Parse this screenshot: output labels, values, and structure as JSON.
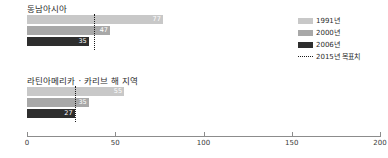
{
  "chart_data": {
    "type": "bar",
    "orientation": "horizontal",
    "title": "",
    "xlabel": "",
    "ylabel": "",
    "xlim": [
      0,
      200
    ],
    "xticks": [
      0,
      50,
      100,
      150,
      200
    ],
    "xtick_labels": [
      "0",
      "50",
      "100",
      "150",
      "200"
    ],
    "grid": false,
    "legend_position": "right",
    "categories": [
      "동남아시아",
      "라틴아메리카 · 카리브 해 지역"
    ],
    "series": [
      {
        "name": "1991년",
        "color": "#c8c8c8",
        "values": [
          77,
          55
        ]
      },
      {
        "name": "2000년",
        "color": "#a8a8a8",
        "values": [
          47,
          35
        ]
      },
      {
        "name": "2006년",
        "color": "#2e2e2e",
        "values": [
          35,
          27
        ]
      }
    ],
    "target_line": {
      "name": "2015년 목표치",
      "style": "dotted",
      "color": "#1a1a1a",
      "values": [
        38,
        27
      ]
    },
    "groups": [
      {
        "label": "동남아시아",
        "target": 38,
        "bars": [
          {
            "series": "1991년",
            "value": 77,
            "label": "77",
            "color": "#c8c8c8"
          },
          {
            "series": "2000년",
            "value": 47,
            "label": "47",
            "color": "#a8a8a8"
          },
          {
            "series": "2006년",
            "value": 35,
            "label": "35",
            "color": "#2e2e2e"
          }
        ]
      },
      {
        "label": "라틴아메리카 · 카리브 해 지역",
        "target": 27,
        "bars": [
          {
            "series": "1991년",
            "value": 55,
            "label": "55",
            "color": "#c8c8c8"
          },
          {
            "series": "2000년",
            "value": 35,
            "label": "35",
            "color": "#a8a8a8"
          },
          {
            "series": "2006년",
            "value": 27,
            "label": "27",
            "color": "#2e2e2e"
          }
        ]
      }
    ]
  },
  "legend": {
    "items": [
      {
        "label": "1991년",
        "color": "#c8c8c8",
        "type": "swatch"
      },
      {
        "label": "2000년",
        "color": "#a8a8a8",
        "type": "swatch"
      },
      {
        "label": "2006년",
        "color": "#2e2e2e",
        "type": "swatch"
      },
      {
        "label": "2015년 목표치",
        "color": "#1a1a1a",
        "type": "dotted"
      }
    ]
  },
  "axis": {
    "tick_labels": [
      "0",
      "50",
      "100",
      "150",
      "200"
    ]
  }
}
